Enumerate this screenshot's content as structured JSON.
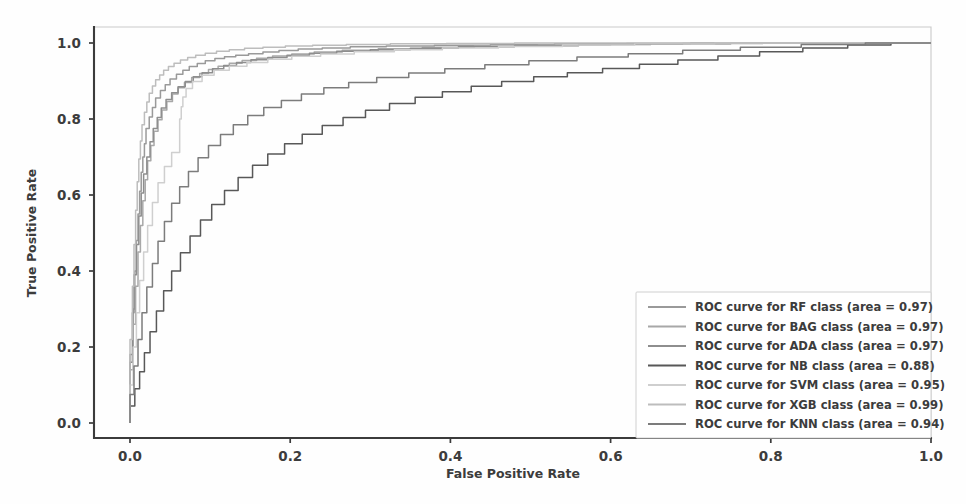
{
  "figure": {
    "background": "#fefefe",
    "width": 966,
    "height": 504
  },
  "chart_data": {
    "type": "line",
    "title": "",
    "xlabel": "False Positive Rate",
    "ylabel": "True Positive Rate",
    "xlim": [
      0.0,
      1.0
    ],
    "ylim": [
      0.0,
      1.0
    ],
    "xticks": [
      "0.0",
      "0.2",
      "0.4",
      "0.6",
      "0.8",
      "1.0"
    ],
    "xtick_values": [
      0.0,
      0.2,
      0.4,
      0.6,
      0.8,
      1.0
    ],
    "yticks": [
      "0.0",
      "0.2",
      "0.4",
      "0.6",
      "0.8",
      "1.0"
    ],
    "ytick_values": [
      0.0,
      0.2,
      0.4,
      0.6,
      0.8,
      1.0
    ],
    "grid": false,
    "legend_position": "lower right",
    "series": [
      {
        "name": "RF",
        "label": "ROC curve for RF class (area = 0.97)",
        "area": 0.97,
        "color": "#9a9a9a",
        "x": [
          0.0,
          0.004,
          0.006,
          0.008,
          0.01,
          0.012,
          0.014,
          0.016,
          0.018,
          0.02,
          0.024,
          0.028,
          0.032,
          0.038,
          0.044,
          0.05,
          0.058,
          0.066,
          0.074,
          0.084,
          0.094,
          0.106,
          0.118,
          0.132,
          0.148,
          0.166,
          0.186,
          0.21,
          0.24,
          0.275,
          0.32,
          0.38,
          0.45,
          0.53,
          0.62,
          0.7,
          0.8,
          0.9,
          1.0
        ],
        "y": [
          0.0,
          0.18,
          0.3,
          0.4,
          0.48,
          0.55,
          0.61,
          0.66,
          0.7,
          0.735,
          0.775,
          0.805,
          0.83,
          0.855,
          0.875,
          0.89,
          0.905,
          0.918,
          0.928,
          0.938,
          0.946,
          0.953,
          0.959,
          0.964,
          0.968,
          0.972,
          0.976,
          0.98,
          0.984,
          0.987,
          0.99,
          0.992,
          0.994,
          0.996,
          0.998,
          0.999,
          1.0,
          1.0,
          1.0
        ]
      },
      {
        "name": "BAG",
        "label": "ROC curve for BAG class (area = 0.97)",
        "area": 0.97,
        "color": "#a8a8a8",
        "x": [
          0.0,
          0.004,
          0.007,
          0.01,
          0.013,
          0.016,
          0.019,
          0.022,
          0.026,
          0.03,
          0.035,
          0.04,
          0.046,
          0.053,
          0.06,
          0.068,
          0.077,
          0.087,
          0.098,
          0.11,
          0.124,
          0.14,
          0.158,
          0.178,
          0.202,
          0.23,
          0.265,
          0.31,
          0.365,
          0.43,
          0.51,
          0.6,
          0.69,
          0.79,
          0.89,
          1.0
        ],
        "y": [
          0.0,
          0.14,
          0.26,
          0.36,
          0.45,
          0.52,
          0.585,
          0.64,
          0.69,
          0.73,
          0.768,
          0.798,
          0.824,
          0.846,
          0.866,
          0.882,
          0.896,
          0.909,
          0.92,
          0.93,
          0.939,
          0.947,
          0.954,
          0.96,
          0.966,
          0.971,
          0.976,
          0.981,
          0.985,
          0.989,
          0.992,
          0.995,
          0.997,
          0.999,
          1.0,
          1.0
        ]
      },
      {
        "name": "ADA",
        "label": "ROC curve for ADA class (area = 0.97)",
        "area": 0.97,
        "color": "#8e8e8e",
        "x": [
          0.0,
          0.003,
          0.005,
          0.008,
          0.011,
          0.014,
          0.017,
          0.021,
          0.025,
          0.029,
          0.034,
          0.039,
          0.045,
          0.052,
          0.06,
          0.069,
          0.079,
          0.09,
          0.103,
          0.117,
          0.133,
          0.151,
          0.172,
          0.196,
          0.224,
          0.258,
          0.3,
          0.35,
          0.41,
          0.48,
          0.56,
          0.65,
          0.75,
          0.86,
          1.0
        ],
        "y": [
          0.0,
          0.16,
          0.29,
          0.39,
          0.47,
          0.545,
          0.605,
          0.655,
          0.7,
          0.74,
          0.775,
          0.804,
          0.829,
          0.851,
          0.869,
          0.885,
          0.899,
          0.911,
          0.922,
          0.932,
          0.941,
          0.949,
          0.956,
          0.962,
          0.968,
          0.973,
          0.978,
          0.982,
          0.986,
          0.99,
          0.993,
          0.996,
          0.998,
          1.0,
          1.0
        ]
      },
      {
        "name": "NB",
        "label": "ROC curve for NB class (area = 0.88)",
        "area": 0.88,
        "color": "#585858",
        "x": [
          0.0,
          0.006,
          0.012,
          0.018,
          0.025,
          0.033,
          0.042,
          0.052,
          0.063,
          0.075,
          0.088,
          0.102,
          0.118,
          0.135,
          0.153,
          0.172,
          0.193,
          0.215,
          0.24,
          0.266,
          0.294,
          0.324,
          0.356,
          0.39,
          0.426,
          0.464,
          0.504,
          0.546,
          0.59,
          0.636,
          0.684,
          0.734,
          0.786,
          0.84,
          0.896,
          0.95,
          1.0
        ],
        "y": [
          0.0,
          0.045,
          0.09,
          0.135,
          0.185,
          0.24,
          0.295,
          0.348,
          0.4,
          0.448,
          0.492,
          0.534,
          0.575,
          0.612,
          0.646,
          0.678,
          0.708,
          0.735,
          0.76,
          0.783,
          0.804,
          0.823,
          0.841,
          0.857,
          0.872,
          0.886,
          0.899,
          0.911,
          0.922,
          0.933,
          0.944,
          0.955,
          0.966,
          0.977,
          0.987,
          0.995,
          1.0
        ]
      },
      {
        "name": "SVM",
        "label": "ROC curve for SVM class (area = 0.95)",
        "area": 0.95,
        "color": "#cfcfcf",
        "x": [
          0.0,
          0.004,
          0.008,
          0.012,
          0.017,
          0.022,
          0.028,
          0.035,
          0.043,
          0.052,
          0.062,
          0.062,
          0.064,
          0.066,
          0.07,
          0.078,
          0.09,
          0.105,
          0.124,
          0.146,
          0.172,
          0.202,
          0.238,
          0.28,
          0.33,
          0.39,
          0.46,
          0.54,
          0.63,
          0.73,
          0.84,
          1.0
        ],
        "y": [
          0.0,
          0.1,
          0.2,
          0.29,
          0.375,
          0.45,
          0.52,
          0.58,
          0.632,
          0.675,
          0.712,
          0.76,
          0.8,
          0.832,
          0.858,
          0.88,
          0.899,
          0.915,
          0.928,
          0.939,
          0.949,
          0.957,
          0.965,
          0.971,
          0.977,
          0.982,
          0.987,
          0.991,
          0.995,
          0.998,
          1.0,
          1.0
        ]
      },
      {
        "name": "XGB",
        "label": "ROC curve for XGB class (area = 0.99)",
        "area": 0.99,
        "color": "#bdbdbd",
        "x": [
          0.0,
          0.003,
          0.005,
          0.007,
          0.009,
          0.011,
          0.013,
          0.015,
          0.018,
          0.021,
          0.024,
          0.028,
          0.032,
          0.037,
          0.042,
          0.048,
          0.055,
          0.063,
          0.072,
          0.082,
          0.094,
          0.108,
          0.124,
          0.143,
          0.166,
          0.194,
          0.228,
          0.27,
          0.325,
          0.395,
          0.48,
          0.58,
          0.7,
          0.84,
          1.0
        ],
        "y": [
          0.0,
          0.22,
          0.36,
          0.47,
          0.56,
          0.635,
          0.695,
          0.742,
          0.785,
          0.818,
          0.845,
          0.868,
          0.887,
          0.903,
          0.916,
          0.928,
          0.938,
          0.947,
          0.955,
          0.962,
          0.968,
          0.973,
          0.978,
          0.982,
          0.986,
          0.989,
          0.992,
          0.994,
          0.996,
          0.998,
          0.999,
          1.0,
          1.0,
          1.0,
          1.0
        ]
      },
      {
        "name": "KNN",
        "label": "ROC curve for KNN class (area = 0.94)",
        "area": 0.94,
        "color": "#7c7c7c",
        "x": [
          0.0,
          0.005,
          0.01,
          0.015,
          0.021,
          0.028,
          0.035,
          0.043,
          0.052,
          0.062,
          0.073,
          0.085,
          0.098,
          0.113,
          0.129,
          0.147,
          0.167,
          0.189,
          0.214,
          0.242,
          0.273,
          0.308,
          0.348,
          0.393,
          0.443,
          0.498,
          0.558,
          0.622,
          0.69,
          0.762,
          0.838,
          0.918,
          1.0
        ],
        "y": [
          0.0,
          0.075,
          0.15,
          0.22,
          0.29,
          0.358,
          0.42,
          0.478,
          0.53,
          0.578,
          0.622,
          0.662,
          0.698,
          0.73,
          0.759,
          0.785,
          0.809,
          0.83,
          0.849,
          0.866,
          0.882,
          0.896,
          0.909,
          0.921,
          0.932,
          0.943,
          0.953,
          0.963,
          0.972,
          0.981,
          0.989,
          0.996,
          1.0
        ]
      }
    ]
  }
}
